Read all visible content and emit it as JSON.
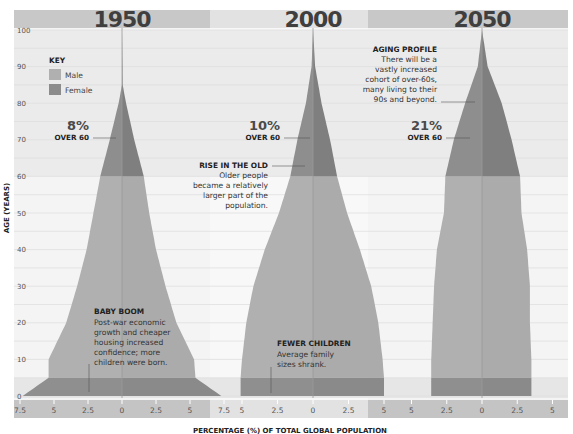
{
  "chart_data": {
    "type": "area",
    "title": "",
    "xlabel": "PERCENTAGE (%) OF TOTAL GLOBAL POPULATION",
    "ylabel": "AGE (YEARS)",
    "ylim": [
      0,
      100
    ],
    "y_ticks": [
      0,
      10,
      20,
      30,
      40,
      50,
      60,
      70,
      80,
      90,
      100
    ],
    "grid": true,
    "legend": {
      "title": "KEY",
      "position": "upper-left",
      "entries": [
        {
          "label": "Male",
          "color": "#b0b0b0"
        },
        {
          "label": "Female",
          "color": "#8c8c8c"
        }
      ]
    },
    "panels": [
      {
        "year": "1950",
        "x_ticks": [
          "7.5",
          "5",
          "2.5",
          "0",
          "2.5",
          "5",
          "7.5"
        ],
        "x_tick_values": [
          -7.5,
          -5,
          -2.5,
          0,
          2.5,
          5,
          7.5
        ],
        "ages": [
          0,
          5,
          10,
          20,
          30,
          40,
          50,
          60,
          70,
          80,
          85,
          100
        ],
        "male_pct": [
          7.3,
          5.4,
          5.4,
          4.1,
          3.3,
          2.6,
          2.1,
          1.6,
          0.9,
          0.25,
          0.0,
          0.0
        ],
        "female_pct": [
          7.3,
          5.4,
          5.3,
          4.0,
          3.2,
          2.5,
          2.0,
          1.6,
          0.9,
          0.3,
          0.05,
          0.0
        ],
        "over_60_pct": "8%",
        "over_60_label": "OVER 60"
      },
      {
        "year": "2000",
        "x_ticks": [
          "5",
          "2.5",
          "0",
          "2.5",
          "5"
        ],
        "x_tick_values": [
          -5,
          -2.5,
          0,
          2.5,
          5
        ],
        "ages": [
          0,
          5,
          10,
          20,
          30,
          40,
          50,
          60,
          70,
          80,
          90,
          100
        ],
        "male_pct": [
          5.1,
          5.1,
          5.0,
          4.7,
          4.2,
          3.4,
          2.4,
          1.6,
          1.1,
          0.5,
          0.1,
          0.0
        ],
        "female_pct": [
          5.0,
          5.0,
          4.9,
          4.6,
          4.1,
          3.3,
          2.4,
          1.7,
          1.2,
          0.6,
          0.15,
          0.0
        ],
        "over_60_pct": "10%",
        "over_60_label": "OVER 60"
      },
      {
        "year": "2050",
        "x_ticks": [
          "5",
          "2.5",
          "0",
          "2.5",
          "5"
        ],
        "x_tick_values": [
          -5,
          -2.5,
          0,
          2.5,
          5
        ],
        "ages": [
          0,
          5,
          10,
          20,
          30,
          40,
          50,
          60,
          70,
          80,
          90,
          100
        ],
        "male_pct": [
          3.6,
          3.6,
          3.6,
          3.5,
          3.4,
          3.2,
          2.7,
          2.6,
          2.0,
          1.2,
          0.3,
          0.0
        ],
        "female_pct": [
          3.5,
          3.5,
          3.5,
          3.4,
          3.4,
          3.2,
          2.8,
          2.7,
          2.1,
          1.4,
          0.4,
          0.0
        ],
        "over_60_pct": "21%",
        "over_60_label": "OVER 60"
      }
    ],
    "annotations": [
      {
        "panel": "1950",
        "title": "BABY BOOM",
        "text": "Post-war economic growth and cheaper housing increased confidence; more children were born."
      },
      {
        "panel": "2000",
        "title": "RISE IN THE OLD",
        "text": "Older people became a relatively larger part of the population."
      },
      {
        "panel": "2000",
        "title": "FEWER CHILDREN",
        "text": "Average family sizes shrank."
      },
      {
        "panel": "2050",
        "title": "AGING PROFILE",
        "text": "There will be a vastly increased cohort of over-60s, many living to their 90s and beyond."
      }
    ]
  },
  "labels": {
    "years": [
      "1950",
      "2000",
      "2050"
    ],
    "y_axis_label": "AGE (YEARS)",
    "x_axis_label": "PERCENTAGE (%) OF TOTAL GLOBAL POPULATION",
    "y_ticks": [
      "100",
      "90",
      "80",
      "70",
      "60",
      "50",
      "40",
      "30",
      "20",
      "10",
      "0"
    ],
    "key": {
      "title": "KEY",
      "male": "Male",
      "female": "Female"
    },
    "p1950": {
      "pct": "8%",
      "over": "OVER 60",
      "ticks": [
        "7.5",
        "5",
        "2.5",
        "0",
        "2.5",
        "5",
        "7.5"
      ]
    },
    "p2000": {
      "pct": "10%",
      "over": "OVER 60",
      "ticks": [
        "5",
        "2.5",
        "0",
        "2.5",
        "5"
      ]
    },
    "p2050": {
      "pct": "21%",
      "over": "OVER 60",
      "ticks": [
        "5",
        "2.5",
        "0",
        "2.5",
        "5"
      ]
    },
    "ann": {
      "baby_boom": {
        "title": "BABY BOOM",
        "lines": [
          "Post-war economic",
          "growth and cheaper",
          "housing increased",
          "confidence; more",
          "children were born."
        ]
      },
      "rise_old": {
        "title": "RISE IN THE OLD",
        "lines": [
          "Older people",
          "became a relatively",
          "larger part of the",
          "population."
        ]
      },
      "fewer_children": {
        "title": "FEWER CHILDREN",
        "lines": [
          "Average family",
          "sizes shrank."
        ]
      },
      "aging_profile": {
        "title": "AGING PROFILE",
        "lines": [
          "There will be a",
          "vastly increased",
          "cohort of over-60s,",
          "many living to their",
          "90s and beyond."
        ]
      }
    }
  },
  "colors": {
    "male": "#b0b0b0",
    "female": "#8c8c8c",
    "over60_male": "#8e8e8e",
    "over60_female": "#7f7f7f",
    "under5": "#8f8f8f",
    "band_dark": "#c9c9c9",
    "band_light": "#e0e0e0",
    "panel_bg_a": "#f3f3f3",
    "panel_bg_b": "#f8f8f8",
    "grid": "#dddddd"
  }
}
